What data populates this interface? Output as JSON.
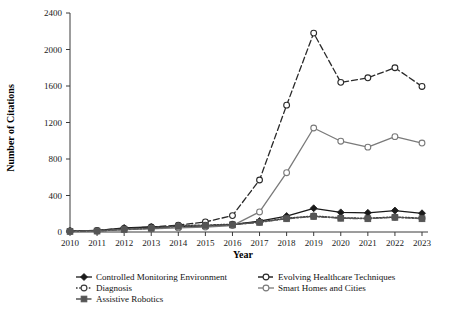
{
  "chart_data": {
    "type": "line",
    "title": "",
    "xlabel": "Year",
    "ylabel": "Number of Citations",
    "categories": [
      2010,
      2011,
      2012,
      2013,
      2014,
      2015,
      2016,
      2017,
      2018,
      2019,
      2020,
      2021,
      2022,
      2023
    ],
    "x_tick_labels": [
      "2010",
      "2011",
      "2012",
      "2013",
      "2014",
      "2015",
      "2016",
      "2017",
      "2018",
      "2019",
      "2020",
      "2021",
      "2022",
      "2023"
    ],
    "y_tick_labels": [
      "0",
      "400",
      "800",
      "1200",
      "1600",
      "2000",
      "2400"
    ],
    "y_ticks": [
      0,
      400,
      800,
      1200,
      1600,
      2000,
      2400
    ],
    "ylim": [
      0,
      2400
    ],
    "grid": false,
    "legend_position": "bottom",
    "series": [
      {
        "name": "Controlled Monitoring Environment",
        "color": "#1a1a1a",
        "line_style": "solid",
        "marker": "filled-diamond",
        "values": [
          10,
          15,
          45,
          55,
          60,
          65,
          80,
          120,
          175,
          260,
          215,
          210,
          235,
          205
        ]
      },
      {
        "name": "Evolving Healthcare Techniques",
        "color": "#2a2a2a",
        "line_style": "dashed",
        "marker": "open-circle",
        "values": [
          12,
          18,
          40,
          55,
          75,
          110,
          180,
          570,
          1390,
          2180,
          1640,
          1690,
          1800,
          1595
        ]
      },
      {
        "name": "Diagnosis",
        "color": "#3a3a3a",
        "line_style": "dotted",
        "marker": "open-circle",
        "values": [
          8,
          12,
          30,
          42,
          70,
          75,
          85,
          110,
          150,
          175,
          155,
          150,
          165,
          150
        ]
      },
      {
        "name": "Smart Homes and Cities",
        "color": "#7a7a7a",
        "line_style": "solid",
        "marker": "open-circle",
        "values": [
          5,
          10,
          25,
          35,
          45,
          55,
          70,
          220,
          650,
          1140,
          995,
          930,
          1045,
          975
        ]
      },
      {
        "name": "Assistive Robotics",
        "color": "#555555",
        "line_style": "dash-dot",
        "marker": "filled-square",
        "values": [
          6,
          10,
          28,
          40,
          62,
          68,
          78,
          105,
          145,
          170,
          150,
          145,
          160,
          145
        ]
      }
    ]
  },
  "legend": {
    "entries": [
      {
        "label": "Controlled Monitoring Environment",
        "column": 0
      },
      {
        "label": "Diagnosis",
        "column": 0
      },
      {
        "label": "Assistive Robotics",
        "column": 0
      },
      {
        "label": "Evolving Healthcare Techniques",
        "column": 1
      },
      {
        "label": "Smart Homes and Cities",
        "column": 1
      }
    ]
  }
}
